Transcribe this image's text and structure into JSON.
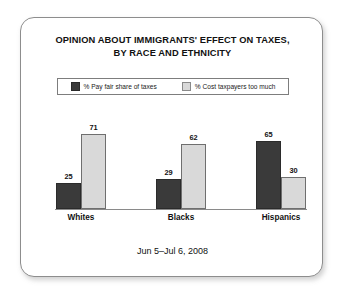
{
  "card": {
    "title_lines": [
      "OPINION ABOUT IMMIGRANTS' EFFECT ON TAXES,",
      "BY RACE AND ETHNICITY"
    ],
    "footer": "Jun 5–Jul 6, 2008"
  },
  "legend": {
    "items": [
      {
        "label": "% Pay fair share of taxes",
        "swatch": "dark-swatch-icon",
        "color": "#3a3a3a"
      },
      {
        "label": "% Cost taxpayers too much",
        "swatch": "light-swatch-icon",
        "color": "#d9d9d9"
      }
    ]
  },
  "chart_data": {
    "type": "bar",
    "title": "OPINION ABOUT IMMIGRANTS' EFFECT ON TAXES, BY RACE AND ETHNICITY",
    "subtitle": "Jun 5–Jul 6, 2008",
    "categories": [
      "Whites",
      "Blacks",
      "Hispanics"
    ],
    "series": [
      {
        "name": "% Pay fair share of taxes",
        "color": "#3a3a3a",
        "values": [
          25,
          29,
          65
        ]
      },
      {
        "name": "% Cost taxpayers too much",
        "color": "#d9d9d9",
        "values": [
          71,
          62,
          30
        ]
      }
    ],
    "xlabel": "",
    "ylabel": "",
    "ylim": [
      0,
      80
    ],
    "grid": false,
    "legend_position": "top",
    "value_labels": true
  }
}
